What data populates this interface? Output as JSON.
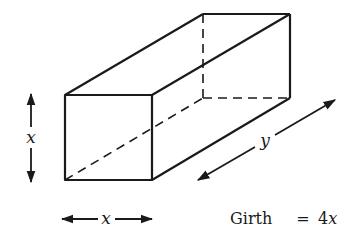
{
  "diagram": {
    "labels": {
      "height": "x",
      "width": "x",
      "length": "y",
      "girth_prefix": "Girth",
      "girth_equals": "=",
      "girth_value": "4x"
    },
    "colors": {
      "stroke": "#1a1a1a",
      "background": "#ffffff"
    }
  }
}
